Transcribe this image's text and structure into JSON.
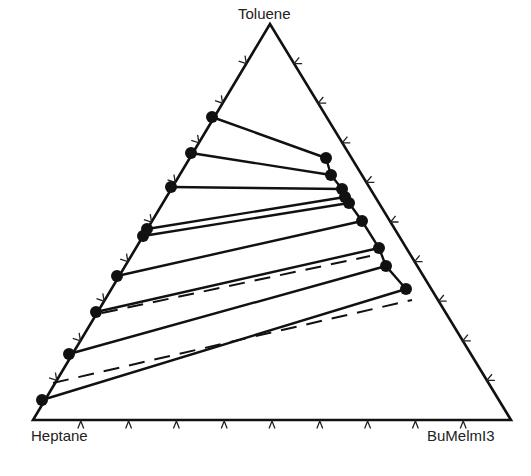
{
  "chart_data": {
    "type": "ternary",
    "title": "",
    "vertices": {
      "top": "Toluene",
      "bottom_left": "Heptane",
      "bottom_right": "BuMeIm I3"
    },
    "vertex_labels": {
      "top": "Toluene",
      "bottom_left": "Heptane",
      "bottom_right": "BuMelmI3"
    },
    "ticks_per_side": 10,
    "grid": false,
    "tie_lines_experimental": [
      {
        "heptane_phase": {
          "toluene": 0.765,
          "bumeim": 0.0
        },
        "il_phase": {
          "toluene": 0.662,
          "bumeim": 0.285
        }
      },
      {
        "heptane_phase": {
          "toluene": 0.674,
          "bumeim": 0.0
        },
        "il_phase": {
          "toluene": 0.619,
          "bumeim": 0.317
        }
      },
      {
        "heptane_phase": {
          "toluene": 0.588,
          "bumeim": 0.0
        },
        "il_phase": {
          "toluene": 0.583,
          "bumeim": 0.357
        }
      },
      {
        "heptane_phase": {
          "toluene": 0.482,
          "bumeim": 0.0
        },
        "il_phase": {
          "toluene": 0.563,
          "bumeim": 0.374
        }
      },
      {
        "heptane_phase": {
          "toluene": 0.465,
          "bumeim": 0.0
        },
        "il_phase": {
          "toluene": 0.548,
          "bumeim": 0.389
        }
      },
      {
        "heptane_phase": {
          "toluene": 0.364,
          "bumeim": 0.0
        },
        "il_phase": {
          "toluene": 0.503,
          "bumeim": 0.439
        }
      },
      {
        "heptane_phase": {
          "toluene": 0.273,
          "bumeim": 0.0
        },
        "il_phase": {
          "toluene": 0.434,
          "bumeim": 0.509
        }
      },
      {
        "heptane_phase": {
          "toluene": 0.167,
          "bumeim": 0.0
        },
        "il_phase": {
          "toluene": 0.389,
          "bumeim": 0.545
        }
      },
      {
        "heptane_phase": {
          "toluene": 0.051,
          "bumeim": 0.0
        },
        "il_phase": {
          "toluene": 0.331,
          "bumeim": 0.616
        }
      }
    ],
    "tie_lines_calculated_dashed": [
      {
        "from": {
          "toluene": 0.27,
          "bumeim": 0.0
        },
        "to": {
          "toluene": 0.417,
          "bumeim": 0.56
        }
      },
      {
        "from": {
          "toluene": 0.093,
          "bumeim": 0.0
        },
        "to": {
          "toluene": 0.303,
          "bumeim": 0.622
        }
      }
    ],
    "pixel_geometry": {
      "top": [
        270,
        24
      ],
      "bottom_left": [
        33,
        420
      ],
      "bottom_right": [
        511,
        420
      ],
      "solid_lines": [
        [
          [
            212,
            117
          ],
          [
            326,
            158
          ]
        ],
        [
          [
            191,
            153
          ],
          [
            331,
            175
          ]
        ],
        [
          [
            171,
            187
          ],
          [
            342,
            189
          ]
        ],
        [
          [
            147,
            229
          ],
          [
            345,
            197
          ]
        ],
        [
          [
            143,
            236
          ],
          [
            349,
            203
          ]
        ],
        [
          [
            117,
            276
          ],
          [
            362,
            221
          ]
        ],
        [
          [
            96,
            312
          ],
          [
            379,
            248
          ]
        ],
        [
          [
            69,
            354
          ],
          [
            386,
            266
          ]
        ],
        [
          [
            42,
            400
          ],
          [
            406,
            289
          ]
        ]
      ],
      "dashed_lines": [
        [
          [
            102,
            313
          ],
          [
            370,
            256
          ]
        ],
        [
          [
            53,
            383
          ],
          [
            412,
            300
          ]
        ]
      ]
    }
  }
}
